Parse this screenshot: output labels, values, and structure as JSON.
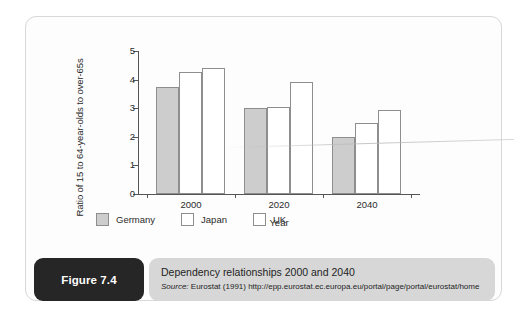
{
  "figure": {
    "badge_label": "Figure 7.4",
    "caption_title": "Dependency relationships 2000 and 2040",
    "source_prefix": "Source:",
    "source_text": " Eurostat (1991) http://epp.eurostat.ec.europa.eu/portal/page/portal/eurostat/home"
  },
  "colors": {
    "germany_fill": "#cdcdcd",
    "japan_fill": "#ffffff",
    "uk_fill": "#ffffff",
    "bar_outline": "#8e8e8e",
    "badge_bg": "#262626",
    "caption_bg": "#d7d7d7",
    "card_border": "#d8d8d8"
  },
  "chart_data": {
    "type": "bar",
    "title": "",
    "xlabel": "Year",
    "ylabel": "Ratio of 15 to 64-year-olds to over-65s",
    "categories": [
      "2000",
      "2020",
      "2040"
    ],
    "series": [
      {
        "name": "Germany",
        "values": [
          3.75,
          3.0,
          2.0
        ],
        "fill": "#cdcdcd"
      },
      {
        "name": "Japan",
        "values": [
          4.27,
          3.05,
          2.5
        ],
        "fill": "#ffffff"
      },
      {
        "name": "UK",
        "values": [
          4.4,
          3.9,
          2.95
        ],
        "fill": "#ffffff"
      }
    ],
    "ylim": [
      0,
      5
    ],
    "yticks": [
      0,
      1,
      2,
      3,
      4,
      5
    ],
    "ytick_labels": [
      "0",
      "1",
      "2",
      "3",
      "4",
      "5"
    ],
    "grid": false,
    "legend_position": "bottom"
  }
}
